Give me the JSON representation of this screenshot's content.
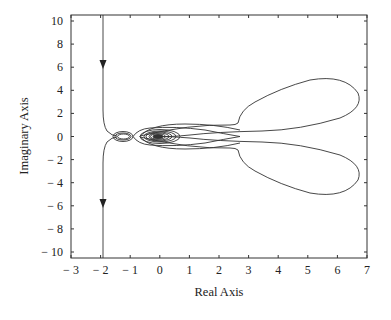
{
  "chart_data": {
    "type": "line",
    "title": "",
    "xlabel": "Real Axis",
    "ylabel": "Imaginary Axis",
    "xlim": [
      -3,
      7
    ],
    "ylim": [
      -10.5,
      10.5
    ],
    "xticks": [
      "− 3",
      "− 2",
      "− 1",
      "0",
      "1",
      "2",
      "3",
      "4",
      "5",
      "6",
      "7"
    ],
    "yticks": [
      "10",
      "8",
      "6",
      "4",
      "2",
      "0",
      "− 2",
      "− 4",
      "− 6",
      "− 8",
      "− 10"
    ],
    "grid": false,
    "legend": null,
    "annotations": [
      "arrow pointing down at (-2, 6.5)",
      "arrow pointing down at (-2, -5.5)"
    ],
    "series": [
      {
        "name": "Nyquist curve (upper branch)",
        "x": [
          -2.0,
          -2.0,
          -2.0,
          -1.95,
          -1.85,
          -1.7,
          -1.6,
          -1.4,
          -1.2,
          -0.9,
          -0.5,
          0.0,
          0.5,
          1.2,
          1.7,
          1.9,
          2.3,
          3.0,
          4.0,
          5.0,
          6.0,
          6.6,
          6.7,
          6.3,
          5.5,
          4.5,
          3.5,
          2.5,
          1.5,
          0.5,
          -0.3
        ],
        "y": [
          10.5,
          6.5,
          2.0,
          1.2,
          0.6,
          0.2,
          0.0,
          -0.2,
          0.0,
          0.3,
          0.6,
          0.7,
          0.7,
          0.5,
          0.0,
          1.0,
          2.5,
          3.8,
          4.6,
          4.9,
          4.5,
          3.5,
          2.5,
          1.5,
          0.8,
          0.3,
          0.3,
          0.5,
          0.5,
          0.3,
          0.0
        ]
      },
      {
        "name": "Nyquist curve (lower branch)",
        "x": [
          -2.0,
          -2.0,
          -2.0,
          -1.95,
          -1.85,
          -1.7,
          -1.6,
          -1.4,
          -1.2,
          -0.9,
          -0.5,
          0.0,
          0.5,
          1.2,
          1.7,
          1.9,
          2.3,
          3.0,
          4.0,
          5.0,
          6.0,
          6.6,
          6.7,
          6.3,
          5.5,
          4.5,
          3.5,
          2.5,
          1.5,
          0.5,
          -0.3
        ],
        "y": [
          -10.5,
          -5.5,
          -2.0,
          -1.2,
          -0.6,
          -0.2,
          0.0,
          0.2,
          0.0,
          -0.3,
          -0.6,
          -0.7,
          -0.7,
          -0.5,
          0.0,
          -1.0,
          -2.5,
          -3.8,
          -4.6,
          -4.9,
          -4.5,
          -3.5,
          -2.5,
          -1.5,
          -0.8,
          -0.3,
          -0.3,
          -0.5,
          -0.5,
          -0.3,
          0.0
        ]
      },
      {
        "name": "Small loop near -1.5",
        "center": [
          -1.45,
          0.0
        ],
        "radius_x": 0.35,
        "radius_y": 0.35
      },
      {
        "name": "Spiral toward origin",
        "center": [
          0.05,
          0.0
        ],
        "radius_x_max": 0.75,
        "radius_y_max": 0.55
      }
    ]
  },
  "axes": {
    "xlabel": "Real Axis",
    "ylabel": "Imaginary Axis"
  }
}
